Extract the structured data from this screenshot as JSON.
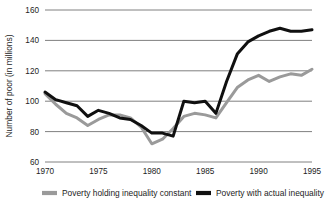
{
  "chart_data": {
    "type": "line",
    "title": "",
    "xlabel": "",
    "ylabel": "Number of poor (in millions)",
    "xlim": [
      1970,
      1995
    ],
    "ylim": [
      60,
      160
    ],
    "xticks": [
      "1970",
      "1975",
      "1980",
      "1985",
      "1990",
      "1995"
    ],
    "yticks": [
      "60",
      "80",
      "100",
      "120",
      "140",
      "160"
    ],
    "grid": "horizontal",
    "legend_position": "bottom",
    "x": [
      1970,
      1971,
      1972,
      1973,
      1974,
      1975,
      1976,
      1977,
      1978,
      1979,
      1980,
      1981,
      1982,
      1983,
      1984,
      1985,
      1986,
      1987,
      1988,
      1989,
      1990,
      1991,
      1992,
      1993,
      1994,
      1995
    ],
    "series": [
      {
        "name": "Poverty holding inequality constant",
        "color": "#9a9a9a",
        "values": [
          105,
          98,
          92,
          89,
          84,
          88,
          91,
          91,
          89,
          83,
          72,
          75,
          82,
          90,
          92,
          91,
          89,
          99,
          109,
          114,
          117,
          113,
          116,
          118,
          117,
          121
        ]
      },
      {
        "name": "Poverty with actual inequality",
        "color": "#101010",
        "values": [
          106,
          101,
          99,
          97,
          90,
          94,
          92,
          89,
          88,
          84,
          79,
          79,
          77,
          100,
          99,
          100,
          92,
          113,
          131,
          139,
          143,
          146,
          148,
          146,
          146,
          147
        ]
      }
    ],
    "legend": [
      {
        "label": "Poverty holding inequality constant",
        "color": "#9a9a9a"
      },
      {
        "label": "Poverty with actual inequality",
        "color": "#101010"
      }
    ]
  }
}
